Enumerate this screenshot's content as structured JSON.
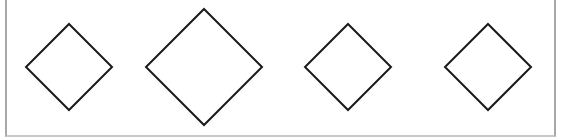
{
  "diagram": {
    "background": "#ffffff",
    "frame_color": "#a8a8a8",
    "stroke_color": "#1a1a1a",
    "stroke_width": 2,
    "shapes": [
      {
        "type": "diamond",
        "cx": 69,
        "cy": 67,
        "half_diagonal": 43,
        "fill": "#ffffff"
      },
      {
        "type": "diamond",
        "cx": 204,
        "cy": 67,
        "half_diagonal": 58,
        "fill": "#ffffff"
      },
      {
        "type": "diamond",
        "cx": 348,
        "cy": 67,
        "half_diagonal": 43,
        "fill": "#ffffff"
      },
      {
        "type": "diamond",
        "cx": 488,
        "cy": 67,
        "half_diagonal": 43,
        "fill": "#ffffff"
      }
    ]
  }
}
